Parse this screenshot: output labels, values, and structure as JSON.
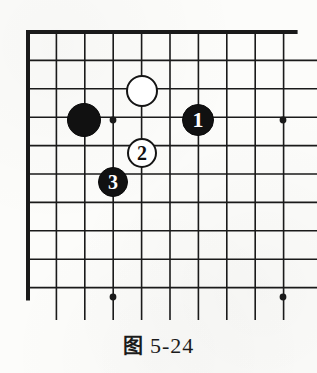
{
  "figure": {
    "caption_prefix": "图",
    "caption_number": "5-24",
    "caption_full": "图 5-24"
  },
  "board": {
    "type": "go-board-corner",
    "description": "Go (weiqi) board top-left corner diagram",
    "origin_x": 28,
    "origin_y": 32,
    "spacing": 28.4,
    "cols_visible": 10,
    "rows_visible": 10,
    "edge_top": true,
    "edge_left": true,
    "line_color": "#1a1a1a",
    "edge_line_width": 4,
    "grid_line_width": 1.6,
    "background_color": "#fcfcfa",
    "star_points": [
      {
        "name": "star-point-upper-left",
        "col": 3,
        "row": 3,
        "x": 113,
        "y": 120
      },
      {
        "name": "star-point-upper-right",
        "col": 9,
        "row": 3,
        "x": 283,
        "y": 120
      },
      {
        "name": "star-point-lower-left",
        "col": 3,
        "row": 9,
        "x": 113,
        "y": 297
      },
      {
        "name": "star-point-lower-right",
        "col": 9,
        "row": 9,
        "x": 283,
        "y": 297
      }
    ],
    "stones": [
      {
        "id": "stone-black-unnumbered",
        "color": "black",
        "label": "",
        "col": 2,
        "row": 3,
        "x": 84,
        "y": 120,
        "radius": 17
      },
      {
        "id": "stone-white-unnumbered",
        "color": "white",
        "label": "",
        "col": 4,
        "row": 2,
        "x": 142,
        "y": 91,
        "radius": 16
      },
      {
        "id": "stone-black-1",
        "color": "black",
        "label": "1",
        "col": 6,
        "row": 3,
        "x": 198,
        "y": 120,
        "radius": 16
      },
      {
        "id": "stone-white-2",
        "color": "white",
        "label": "2",
        "col": 4,
        "row": 4,
        "x": 142,
        "y": 153,
        "radius": 15
      },
      {
        "id": "stone-black-3",
        "color": "black",
        "label": "3",
        "col": 3,
        "row": 5,
        "x": 113,
        "y": 182,
        "radius": 15
      }
    ]
  }
}
